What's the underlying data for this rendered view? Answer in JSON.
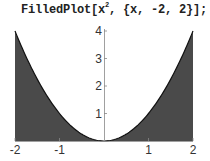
{
  "input_cell": {
    "prefix": "FilledPlot[x",
    "superscript": "2",
    "suffix": ", {x, -2, 2}];"
  },
  "colors": {
    "fill": "#4a4a4a",
    "curve": "#111111",
    "axis": "#888888",
    "text": "#333333"
  },
  "chart_data": {
    "type": "area",
    "title": "",
    "function": "x^2",
    "xlabel": "",
    "ylabel": "",
    "xlim": [
      -2,
      2
    ],
    "ylim": [
      0,
      4
    ],
    "x_ticks": [
      "-2",
      "-1",
      "1",
      "2"
    ],
    "y_ticks": [
      "1",
      "2",
      "3",
      "4"
    ],
    "grid": false,
    "legend": null,
    "x": [
      -2,
      -1.5,
      -1,
      -0.5,
      0,
      0.5,
      1,
      1.5,
      2
    ],
    "series": [
      {
        "name": "x^2",
        "values": [
          4,
          2.25,
          1,
          0.25,
          0,
          0.25,
          1,
          2.25,
          4
        ]
      }
    ],
    "fill": "between curve and top/outside region — area above x-axis up to curve is white; region between curve and frame edges outside parabola is dark"
  }
}
